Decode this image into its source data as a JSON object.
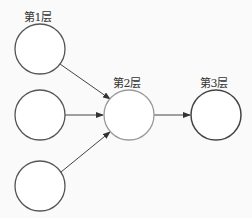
{
  "diagram": {
    "type": "neural-network-layers",
    "labels": {
      "layer1": "第1层",
      "layer2": "第2层",
      "layer3": "第3层"
    },
    "nodes": [
      {
        "id": "l1n1",
        "layer": 1,
        "cx": 40,
        "cy": 49,
        "r": 25
      },
      {
        "id": "l1n2",
        "layer": 1,
        "cx": 40,
        "cy": 115,
        "r": 25
      },
      {
        "id": "l1n3",
        "layer": 1,
        "cx": 40,
        "cy": 186,
        "r": 25
      },
      {
        "id": "l2n1",
        "layer": 2,
        "cx": 129,
        "cy": 115,
        "r": 25
      },
      {
        "id": "l3n1",
        "layer": 3,
        "cx": 216,
        "cy": 115,
        "r": 25
      }
    ],
    "edges": [
      {
        "from": "l1n1",
        "to": "l2n1"
      },
      {
        "from": "l1n2",
        "to": "l2n1"
      },
      {
        "from": "l1n3",
        "to": "l2n1"
      },
      {
        "from": "l2n1",
        "to": "l3n1"
      }
    ],
    "colors": {
      "stroke": "#555555",
      "layer2_stroke": "#9a9a9a",
      "arrow": "#333333"
    }
  }
}
